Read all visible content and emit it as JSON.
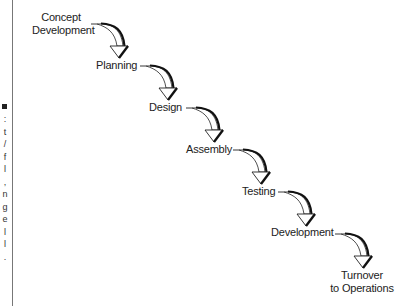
{
  "diagram": {
    "type": "waterfall-process",
    "steps": [
      {
        "label_lines": [
          "Concept",
          "Development"
        ]
      },
      {
        "label_lines": [
          "Planning"
        ]
      },
      {
        "label_lines": [
          "Design"
        ]
      },
      {
        "label_lines": [
          "Assembly"
        ]
      },
      {
        "label_lines": [
          "Testing"
        ]
      },
      {
        "label_lines": [
          "Development"
        ]
      },
      {
        "label_lines": [
          "Turnover",
          "to Operations"
        ]
      }
    ],
    "edges": [
      {
        "from": 0,
        "to": 1
      },
      {
        "from": 1,
        "to": 2
      },
      {
        "from": 2,
        "to": 3
      },
      {
        "from": 3,
        "to": 4
      },
      {
        "from": 4,
        "to": 5
      },
      {
        "from": 5,
        "to": 6
      }
    ]
  },
  "caption_fragments": [
    ":",
    "t",
    "/",
    "f",
    "l",
    ",",
    "n",
    "g",
    "e",
    "l",
    "l",
    "."
  ],
  "colors": {
    "line": "#222222",
    "arrow_fill": "#ffffff",
    "arrow_shadow": "#111111",
    "rule": "#777777"
  }
}
